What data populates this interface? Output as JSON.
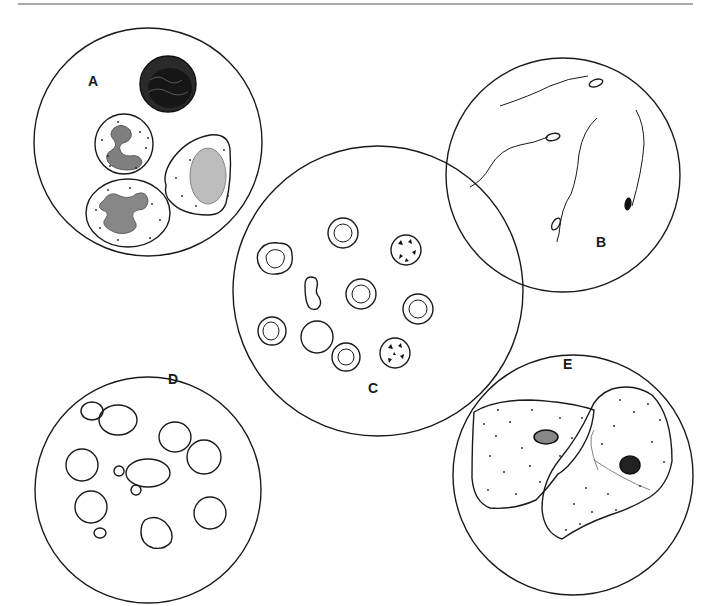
{
  "figure": {
    "type": "microscopy-illustration",
    "panels": [
      {
        "id": "A",
        "label": "A",
        "content": "white blood cells (leukocytes, one dark cell and three granular cells with lobed nuclei)"
      },
      {
        "id": "B",
        "label": "B",
        "content": "spermatozoa (five cells with heads and long tails)"
      },
      {
        "id": "C",
        "label": "C",
        "content": "red blood cells (crenated, normal, ghost and dysmorphic forms)"
      },
      {
        "id": "D",
        "label": "D",
        "content": "yeast cells (budding)"
      },
      {
        "id": "E",
        "label": "E",
        "content": "squamous epithelial cells (two large cells with small nuclei)"
      }
    ]
  },
  "colors": {
    "ink": "#1a1a1a",
    "background": "#ffffff",
    "rule": "#555555"
  }
}
